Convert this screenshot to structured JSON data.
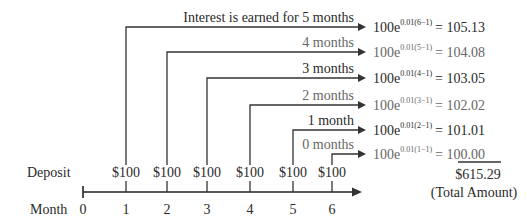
{
  "diagram": {
    "axis": {
      "label_months": "Month",
      "label_deposit": "Deposit",
      "ticks": [
        "0",
        "1",
        "2",
        "3",
        "4",
        "5",
        "6"
      ]
    },
    "deposits": [
      "$100",
      "$100",
      "$100",
      "$100",
      "$100",
      "$100"
    ],
    "rows": [
      {
        "label": "Interest is earned for 5 months",
        "base": "100e",
        "exponent": "0.01(6−1)",
        "result": "= 105.13",
        "month": 1
      },
      {
        "label": "4 months",
        "base": "100e",
        "exponent": "0.01(5−1)",
        "result": "= 104.08",
        "month": 2
      },
      {
        "label": "3 months",
        "base": "100e",
        "exponent": "0.01(4−1)",
        "result": "= 103.05",
        "month": 3
      },
      {
        "label": "2 months",
        "base": "100e",
        "exponent": "0.01(3−1)",
        "result": "= 102.02",
        "month": 4
      },
      {
        "label": "1 month",
        "base": "100e",
        "exponent": "0.01(2−1)",
        "result": "= 101.01",
        "month": 5
      },
      {
        "label": "0 months",
        "base": "100e",
        "exponent": "0.01(1−1)",
        "result": "= 100.00",
        "month": 6
      }
    ],
    "total": {
      "value": "$615.29",
      "label": "(Total Amount)"
    },
    "colors": {
      "line": "#333333",
      "text": "#2a2a2a",
      "muted_text": "#666666"
    }
  }
}
